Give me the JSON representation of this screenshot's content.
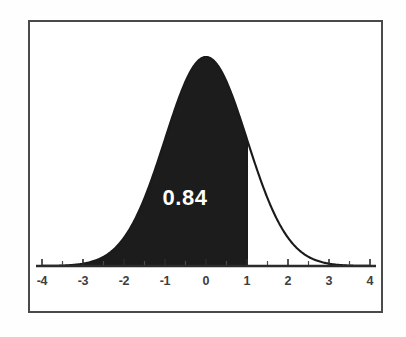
{
  "figure": {
    "name": "standard-normal-distribution-shaded-area",
    "background_color": "#ffffff",
    "frame_color": "#4a4a4a",
    "curve_color": "#1a1a1a",
    "fill_color": "#1c1c1c",
    "label_color": "#ffffff"
  },
  "chart_data": {
    "type": "area",
    "title": "",
    "subtitle": "",
    "xlabel": "",
    "ylabel": "",
    "xlim": [
      -4,
      4
    ],
    "ylim": [
      0,
      0.42
    ],
    "grid": false,
    "legend": null,
    "distribution": "standard normal (mean 0, sd 1)",
    "x_ticks": [
      -4,
      -3,
      -2,
      -1,
      0,
      1,
      2,
      3,
      4
    ],
    "x_tick_labels": [
      "-4",
      "-3",
      "-2",
      "-1",
      "0",
      "1",
      "2",
      "3",
      "4"
    ],
    "minor_ticks_per_interval": 1,
    "y_ticks": [],
    "y_tick_labels": [],
    "shaded_region": {
      "from": -4,
      "to": 1,
      "area": 0.84,
      "label": "0.84",
      "label_x": -0.45,
      "label_y": 0.13,
      "boundary_line_at_x": 1
    },
    "x": [
      -4.0,
      -3.8,
      -3.6,
      -3.4,
      -3.2,
      -3.0,
      -2.8,
      -2.6,
      -2.4,
      -2.2,
      -2.0,
      -1.8,
      -1.6,
      -1.4,
      -1.2,
      -1.0,
      -0.8,
      -0.6,
      -0.4,
      -0.2,
      0.0,
      0.2,
      0.4,
      0.6,
      0.8,
      1.0,
      1.2,
      1.4,
      1.6,
      1.8,
      2.0,
      2.2,
      2.4,
      2.6,
      2.8,
      3.0,
      3.2,
      3.4,
      3.6,
      3.8,
      4.0
    ],
    "y": [
      0.0001,
      0.0003,
      0.0006,
      0.0012,
      0.0024,
      0.0044,
      0.0079,
      0.0136,
      0.0224,
      0.0355,
      0.054,
      0.079,
      0.1109,
      0.1497,
      0.1942,
      0.242,
      0.2897,
      0.3332,
      0.3683,
      0.391,
      0.3989,
      0.391,
      0.3683,
      0.3332,
      0.2897,
      0.242,
      0.1942,
      0.1497,
      0.1109,
      0.079,
      0.054,
      0.0355,
      0.0224,
      0.0136,
      0.0079,
      0.0044,
      0.0024,
      0.0012,
      0.0006,
      0.0003,
      0.0001
    ]
  }
}
